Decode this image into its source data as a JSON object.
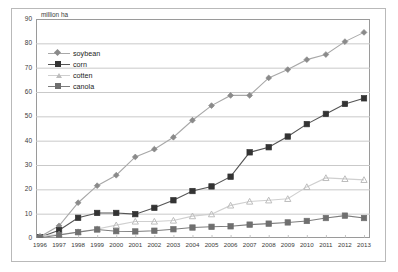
{
  "chart_data": {
    "type": "line",
    "title": "",
    "subtitle": "",
    "xlabel": "",
    "ylabel": "million ha",
    "axis_unit_label": "million ha",
    "grid": true,
    "legend_position": "upper-left-inside",
    "xlim": [
      1996,
      2013
    ],
    "ylim": [
      0,
      90
    ],
    "ytick_step": 10,
    "yticks": [
      0,
      10,
      20,
      30,
      40,
      50,
      60,
      70,
      80,
      90
    ],
    "ytick_labels": [
      "0",
      "10",
      "20",
      "30",
      "40",
      "50",
      "60",
      "70",
      "80",
      "90"
    ],
    "categories": [
      1996,
      1997,
      1998,
      1999,
      2000,
      2001,
      2002,
      2003,
      2004,
      2005,
      2006,
      2007,
      2008,
      2009,
      2010,
      2011,
      2012,
      2013
    ],
    "xtick_labels": [
      "1996",
      "1997",
      "1998",
      "1999",
      "2000",
      "2001",
      "2002",
      "2003",
      "2004",
      "2005",
      "2006",
      "2007",
      "2008",
      "2009",
      "2010",
      "2011",
      "2012",
      "2013"
    ],
    "series": [
      {
        "name": "soybean",
        "marker": "diamond",
        "color": "#8a8a8a",
        "line_color": "#a8a8a8",
        "values": [
          0.5,
          5.0,
          14.5,
          21.5,
          25.8,
          33.3,
          36.5,
          41.4,
          48.4,
          54.4,
          58.6,
          58.6,
          65.8,
          69.2,
          73.3,
          75.4,
          80.7,
          84.5
        ]
      },
      {
        "name": "corn",
        "marker": "square",
        "color": "#333333",
        "line_color": "#555555",
        "values": [
          0.3,
          3.2,
          8.3,
          10.3,
          10.3,
          9.8,
          12.4,
          15.5,
          19.3,
          21.2,
          25.2,
          35.2,
          37.3,
          41.7,
          46.8,
          51.0,
          55.1,
          57.4
        ]
      },
      {
        "name": "cotten",
        "marker": "triangle",
        "color": "#bdbdbd",
        "line_color": "#cfcfcf",
        "values": [
          0.8,
          1.4,
          2.5,
          3.7,
          5.3,
          6.8,
          6.8,
          7.2,
          9.0,
          9.8,
          13.4,
          15.0,
          15.5,
          16.1,
          21.0,
          24.7,
          24.3,
          23.9
        ]
      },
      {
        "name": "canola",
        "marker": "square",
        "color": "#6f6f6f",
        "line_color": "#7d7d7d",
        "values": [
          0.1,
          1.2,
          2.4,
          3.5,
          2.8,
          2.7,
          3.0,
          3.6,
          4.3,
          4.6,
          4.8,
          5.5,
          5.9,
          6.4,
          7.0,
          8.2,
          9.2,
          8.2
        ]
      }
    ],
    "colors": {
      "grid": "#c9c9c9",
      "frame": "#9a9a9a",
      "outer_frame": "#b9b9b9",
      "text": "#3a3a3a",
      "background": "#ffffff"
    }
  },
  "legend": {
    "items": [
      {
        "label": "soybean"
      },
      {
        "label": "corn"
      },
      {
        "label": "cotten"
      },
      {
        "label": "canola"
      }
    ]
  }
}
